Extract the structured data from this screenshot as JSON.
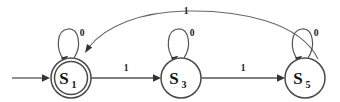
{
  "diagram": {
    "type": "state-transition-diagram",
    "background_color": "#ffffff",
    "stroke_color": "#555555",
    "text_color": "#111111"
  },
  "states": [
    {
      "id": "S1",
      "label": "S",
      "subscript": "1",
      "accepting": true,
      "is_start": true,
      "cx": 71,
      "cy": 78,
      "r": 20
    },
    {
      "id": "S3",
      "label": "S",
      "subscript": "3",
      "accepting": false,
      "is_start": false,
      "cx": 181,
      "cy": 78,
      "r": 20
    },
    {
      "id": "S5",
      "label": "S",
      "subscript": "5",
      "accepting": false,
      "is_start": false,
      "cx": 305,
      "cy": 78,
      "r": 20
    }
  ],
  "transitions": [
    {
      "from": "S1",
      "to": "S1",
      "label": "0",
      "kind": "self-loop",
      "label_x": 82,
      "label_y": 33
    },
    {
      "from": "S3",
      "to": "S3",
      "label": "0",
      "kind": "self-loop",
      "label_x": 192,
      "label_y": 33
    },
    {
      "from": "S5",
      "to": "S5",
      "label": "0",
      "kind": "self-loop",
      "label_x": 316,
      "label_y": 33
    },
    {
      "from": "S1",
      "to": "S3",
      "label": "1",
      "kind": "straight",
      "label_x": 126,
      "label_y": 69
    },
    {
      "from": "S3",
      "to": "S5",
      "label": "1",
      "kind": "straight",
      "label_x": 243,
      "label_y": 69
    },
    {
      "from": "S5",
      "to": "S1",
      "label": "1",
      "kind": "arc",
      "label_x": 186,
      "label_y": 12
    }
  ],
  "start_arrow": {
    "label": "",
    "from_x": 12,
    "to_x": 48,
    "y": 78
  }
}
